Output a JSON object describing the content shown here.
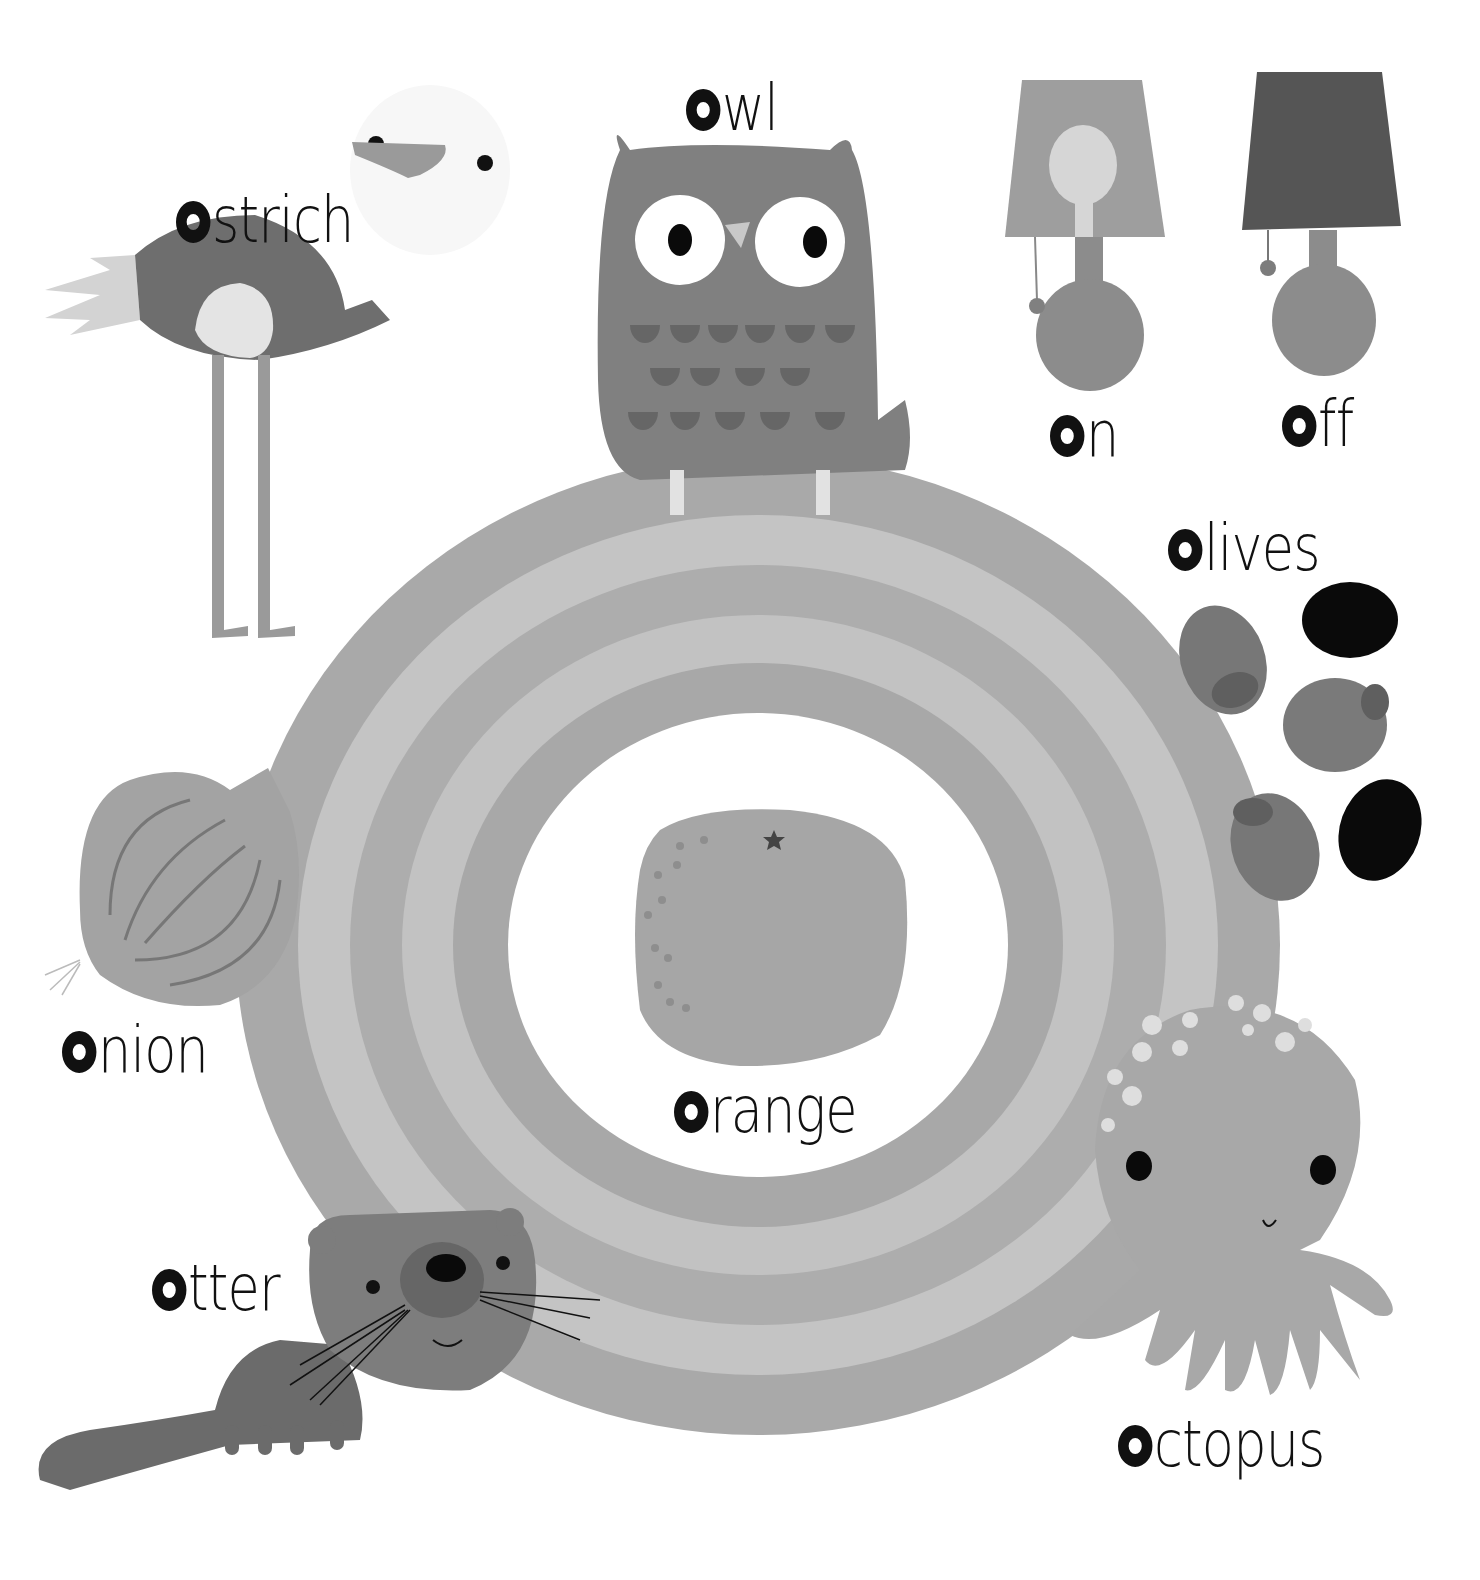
{
  "page": {
    "letter": "o",
    "background": "#ffffff"
  },
  "colors": {
    "ring_outer": "#a9a9a9",
    "ring_band_light": "#c2c2c2",
    "ring_band_mid": "#b0b0b0",
    "ring_inner": "#ffffff",
    "text": "#111111",
    "owl_body": "#7f7f7f",
    "owl_feathers": "#666666",
    "lamp_on_shade": "#9e9e9e",
    "lamp_off_shade": "#555555",
    "lamp_base": "#8c8c8c",
    "olive_green": "#777777",
    "olive_black": "#0a0a0a",
    "orange_fruit": "#a6a6a6",
    "onion": "#a3a3a3",
    "otter": "#6b6b6b",
    "otter_head": "#7d7d7d",
    "octopus": "#a8a8a8",
    "ostrich_body": "#6e6e6e",
    "ostrich_feathers": "#d2d2d2"
  },
  "words": [
    {
      "id": "ostrich",
      "first": "o",
      "rest": "strich",
      "x": 176,
      "y": 188
    },
    {
      "id": "owl",
      "first": "o",
      "rest": "wl",
      "x": 686,
      "y": 76
    },
    {
      "id": "on",
      "first": "o",
      "rest": "n",
      "x": 1050,
      "y": 402
    },
    {
      "id": "off",
      "first": "o",
      "rest": "ff",
      "x": 1282,
      "y": 392
    },
    {
      "id": "olives",
      "first": "o",
      "rest": "lives",
      "x": 1168,
      "y": 516
    },
    {
      "id": "onion",
      "first": "o",
      "rest": "nion",
      "x": 62,
      "y": 1018
    },
    {
      "id": "orange",
      "first": "o",
      "rest": "range",
      "x": 674,
      "y": 1078
    },
    {
      "id": "otter",
      "first": "o",
      "rest": "tter",
      "x": 152,
      "y": 1256
    },
    {
      "id": "octopus",
      "first": "o",
      "rest": "ctopus",
      "x": 1118,
      "y": 1412
    }
  ]
}
